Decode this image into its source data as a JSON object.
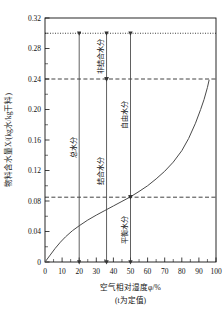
{
  "chart_data": {
    "type": "line",
    "title": "",
    "xlabel": "空气相对湿度φ/%",
    "xlabel_sub": "(t为定值)",
    "ylabel": "物料含水量X/(kg水/kg干料)",
    "xlim": [
      0,
      100
    ],
    "ylim": [
      0,
      0.32
    ],
    "grid": false,
    "legend": "none",
    "x_ticks": [
      10,
      20,
      30,
      40,
      50,
      60,
      70,
      80,
      90,
      100
    ],
    "x_tick_labels": [
      "10",
      "20",
      "30",
      "40",
      "50",
      "60",
      "70",
      "80",
      "90",
      "100"
    ],
    "x_minor_step": 5,
    "y_ticks": [
      0,
      0.04,
      0.08,
      0.12,
      0.16,
      0.2,
      0.24,
      0.28,
      0.32
    ],
    "y_tick_labels": [
      "0",
      "0.04",
      "0.08",
      "0.12",
      "0.16",
      "0.20",
      "0.24",
      "0.28",
      "0.32"
    ],
    "y_minor_step": 0.02,
    "series": [
      {
        "name": "平衡含水量曲线",
        "x": [
          0,
          3,
          6,
          9,
          12,
          16,
          20,
          25,
          30,
          35,
          40,
          45,
          50,
          55,
          60,
          65,
          70,
          75,
          80,
          84,
          88,
          91,
          93,
          95,
          96
        ],
        "y": [
          0.0,
          0.009,
          0.018,
          0.026,
          0.033,
          0.041,
          0.0475,
          0.055,
          0.0615,
          0.0675,
          0.0735,
          0.0795,
          0.0855,
          0.0925,
          0.1,
          0.109,
          0.119,
          0.131,
          0.146,
          0.162,
          0.182,
          0.2,
          0.213,
          0.229,
          0.239
        ]
      }
    ],
    "reference_lines": [
      {
        "name": "total-moisture-level",
        "value": 0.3,
        "style": "dotted",
        "axis": "y"
      },
      {
        "name": "bound-moisture-level",
        "value": 0.24,
        "style": "dashed",
        "axis": "y"
      },
      {
        "name": "equilibrium-moisture-level",
        "value": 0.085,
        "style": "dashed",
        "axis": "y"
      }
    ],
    "annotations": [
      {
        "name": "total-moisture",
        "label": "总水分",
        "x": 20,
        "from": 0.3,
        "to": 0.0
      },
      {
        "name": "bound-moisture",
        "label": "结合水分",
        "x": 36,
        "from": 0.24,
        "to": 0.0
      },
      {
        "name": "non-bound-moisture",
        "label": "非结合水分",
        "x": 36,
        "from": 0.3,
        "to": 0.24
      },
      {
        "name": "free-moisture",
        "label": "自由水分",
        "x": 50,
        "from": 0.3,
        "to": 0.085
      },
      {
        "name": "equilibrium-moisture",
        "label": "平衡水分",
        "x": 50,
        "from": 0.085,
        "to": 0.0
      }
    ]
  }
}
